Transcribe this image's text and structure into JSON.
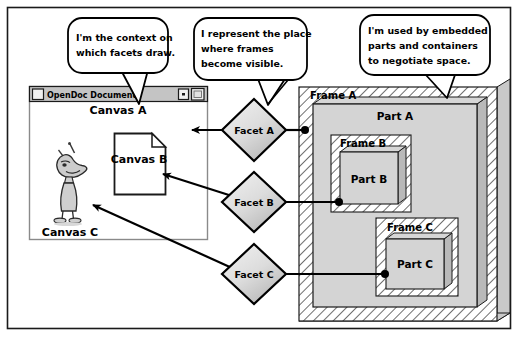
{
  "diagram": {
    "background_color": "#ffffff",
    "border_color": "#000000",
    "fill_gray": "#d0d0d0",
    "hatch_color": "#555555"
  },
  "callouts": [
    {
      "id": "callout-canvas",
      "lines": [
        "I'm the context on",
        "which facets draw."
      ],
      "points_to": "canvas-a"
    },
    {
      "id": "callout-facet",
      "lines": [
        "I represent the place",
        "where frames",
        "become visible."
      ],
      "points_to": "facet-a"
    },
    {
      "id": "callout-frame",
      "lines": [
        "I'm used by embedded",
        "parts and containers",
        "to negotiate space."
      ],
      "points_to": "frame-a"
    }
  ],
  "window": {
    "title": "OpenDoc Document",
    "close_box": "close-box",
    "zoom_box": "zoom-box",
    "collapse_box": "collapse-box"
  },
  "canvases": [
    {
      "id": "canvas-a",
      "label": "Canvas A",
      "kind": "window"
    },
    {
      "id": "canvas-b",
      "label": "Canvas B",
      "kind": "page"
    },
    {
      "id": "canvas-c",
      "label": "Canvas C",
      "kind": "character"
    }
  ],
  "facets": [
    {
      "id": "facet-a",
      "label": "Facet A",
      "connects_to": "part-a"
    },
    {
      "id": "facet-b",
      "label": "Facet B",
      "connects_to": "part-b"
    },
    {
      "id": "facet-c",
      "label": "Facet C",
      "connects_to": "part-c"
    }
  ],
  "frames": [
    {
      "id": "frame-a",
      "label": "Frame A"
    },
    {
      "id": "frame-b",
      "label": "Frame B"
    },
    {
      "id": "frame-c",
      "label": "Frame C"
    }
  ],
  "parts": [
    {
      "id": "part-a",
      "label": "Part A"
    },
    {
      "id": "part-b",
      "label": "Part B"
    },
    {
      "id": "part-c",
      "label": "Part C"
    }
  ],
  "arrows": [
    {
      "id": "arrow-facet-a-to-canvas-a",
      "from": "facet-a",
      "to": "canvas-a"
    },
    {
      "id": "arrow-facet-b-to-canvas-b",
      "from": "facet-b",
      "to": "canvas-b"
    },
    {
      "id": "arrow-facet-c-to-canvas-c",
      "from": "facet-c",
      "to": "canvas-c"
    }
  ],
  "connectors": [
    {
      "id": "connector-facet-a-part-a",
      "from": "facet-a",
      "to": "part-a"
    },
    {
      "id": "connector-facet-b-part-b",
      "from": "facet-b",
      "to": "part-b"
    },
    {
      "id": "connector-facet-c-part-c",
      "from": "facet-c",
      "to": "part-c"
    }
  ]
}
